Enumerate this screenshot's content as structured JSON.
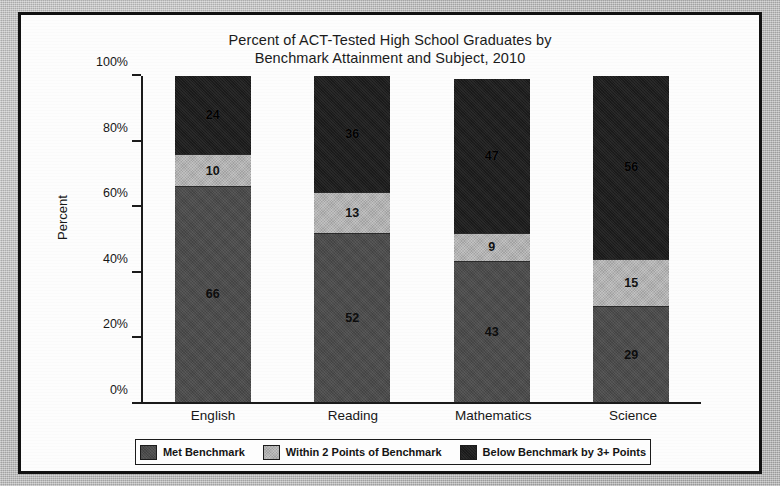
{
  "chart_data": {
    "type": "bar",
    "subtype": "stacked-100-percent",
    "title": "Percent of ACT-Tested High School Graduates by Benchmark Attainment and Subject, 2010",
    "title_lines": [
      "Percent of ACT-Tested High School Graduates by",
      "Benchmark Attainment and Subject, 2010"
    ],
    "xlabel": "",
    "ylabel": "Percent",
    "ylim": [
      0,
      100
    ],
    "yticks": [
      0,
      20,
      40,
      60,
      80,
      100
    ],
    "ytick_labels": [
      "0%",
      "20%",
      "40%",
      "60%",
      "80%",
      "100%"
    ],
    "grid": false,
    "legend_position": "bottom",
    "categories": [
      "English",
      "Reading",
      "Mathematics",
      "Science"
    ],
    "series": [
      {
        "name": "Met Benchmark",
        "color": "#4b4b4b",
        "values": [
          66,
          52,
          43,
          29
        ]
      },
      {
        "name": "Within 2 Points of Benchmark",
        "color": "#b3b3b3",
        "values": [
          10,
          13,
          9,
          15
        ]
      },
      {
        "name": "Below Benchmark by 3+ Points",
        "color": "#1d1d1d",
        "values": [
          24,
          36,
          47,
          56
        ]
      }
    ],
    "bar_labels": {
      "English": [
        "66",
        "10",
        "24"
      ],
      "Reading": [
        "52",
        "13",
        "36"
      ],
      "Mathematics": [
        "43",
        "9",
        "47"
      ],
      "Science": [
        "29",
        "15",
        "56"
      ]
    }
  },
  "legend": {
    "items": [
      {
        "label": "Met Benchmark",
        "color": "#4b4b4b"
      },
      {
        "label": "Within 2 Points of Benchmark",
        "color": "#b3b3b3"
      },
      {
        "label": "Below Benchmark by 3+ Points",
        "color": "#1d1d1d"
      }
    ]
  }
}
